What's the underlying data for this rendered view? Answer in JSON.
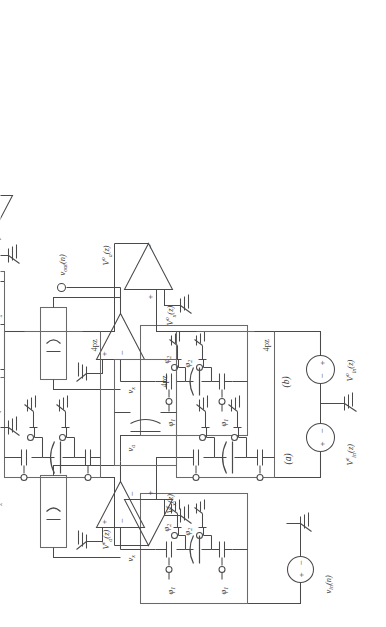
{
  "figure": {
    "type": "circuit-schematic",
    "orientation": "rotated-90-ccw",
    "panels": [
      {
        "id": "a",
        "caption": "(a)",
        "description": "switched-capacitor two-stage circuit, time domain"
      },
      {
        "id": "b",
        "caption": "(b)",
        "description": "z-domain even/odd equivalent half circuit"
      }
    ]
  },
  "panel_a": {
    "caption": "(a)",
    "source_label": "v",
    "source_sub": "in",
    "source_arg": "(n)",
    "source_text": "v_in(n)",
    "source_plus": "+",
    "source_minus": "−",
    "node_x_label": "v",
    "node_x_sub": "x",
    "node_a_label": "v",
    "node_a_sub": "a",
    "output_label": "v",
    "output_sub": "out",
    "output_arg": "(n)",
    "output_text": "v_out(n)",
    "opamp_minus": "−",
    "opamp_plus": "+",
    "phase1": "φ",
    "phase1_sub": "1",
    "phase2": "φ",
    "phase2_sub": "2",
    "sc_block_phases": [
      "φ1",
      "φ2",
      "φ1",
      "φ2"
    ]
  },
  "panel_b": {
    "caption": "(b)",
    "in_even": "V",
    "in_even_sup": "e",
    "in_even_sub": "in",
    "in_even_arg": "(z)",
    "in_even_text": "V^e_in(z)",
    "in_odd": "V",
    "in_odd_sup": "o",
    "in_odd_sub": "in",
    "in_odd_arg": "(z)",
    "in_odd_text": "V^o_in(z)",
    "x_even_text": "V^e_x(z)",
    "x_odd_text": "V^o_x(z)",
    "a_even_text": "V^e_a(z)",
    "a_odd_text": "V^o_a(z)",
    "out_even_text": "V^e_out(z)",
    "out_odd_text": "V^o_out(z)",
    "var_V": "V",
    "sup_e": "e",
    "sup_o": "o",
    "sub_in": "in",
    "sub_x": "x",
    "sub_a": "a",
    "sub_out": "out",
    "arg_z": "(z)",
    "plus": "+",
    "minus": "−",
    "cap_label": "4pz",
    "cap_labels": [
      "4pz",
      "4pz",
      "4pz",
      "4pz"
    ],
    "opamp_minus": "−",
    "opamp_plus": "+"
  },
  "colors": {
    "line": "#4a4a4a",
    "box": "#6a6a6a",
    "text": "#3c3c3c",
    "background": "#ffffff"
  }
}
